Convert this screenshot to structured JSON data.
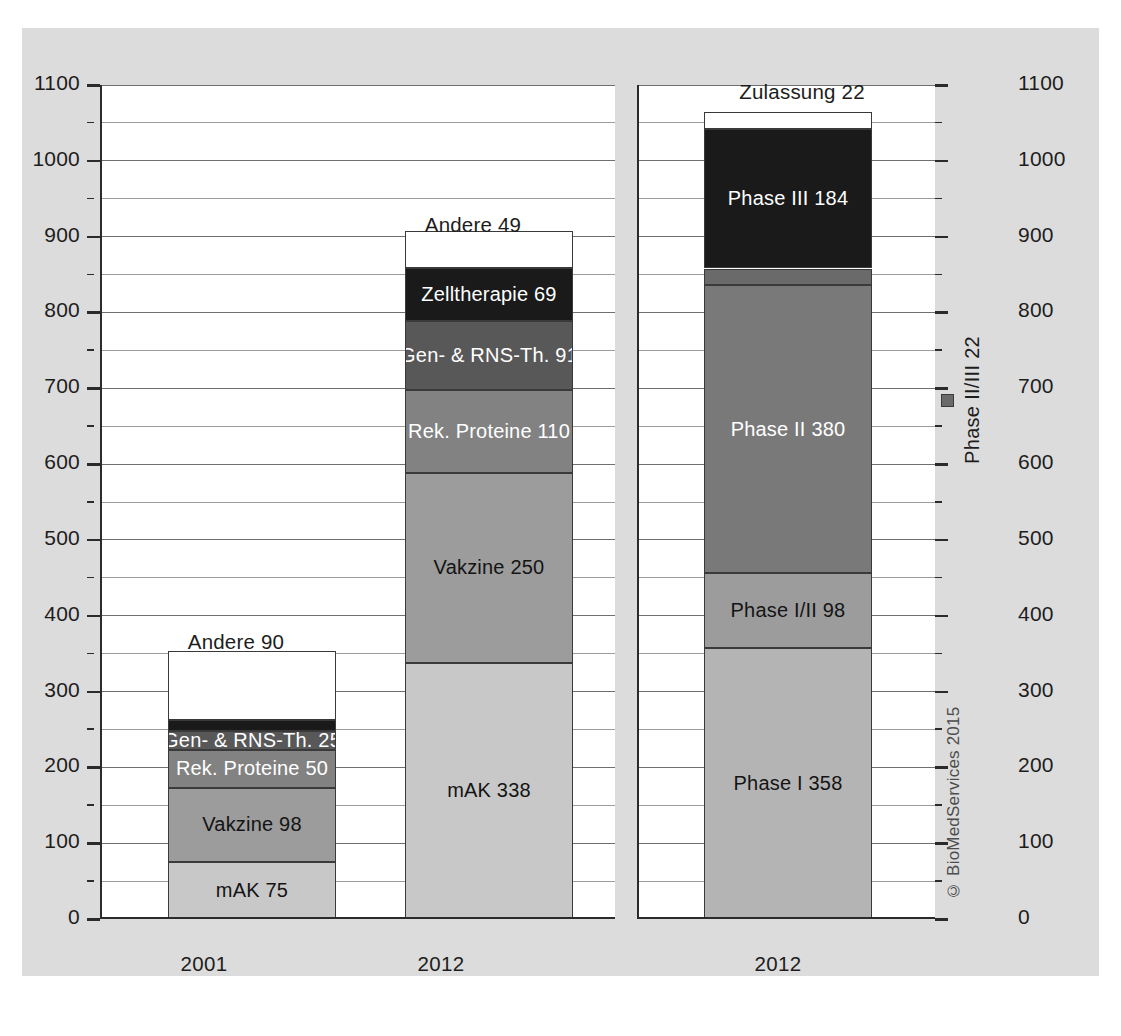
{
  "chart_data": {
    "type": "bar",
    "subtype": "stacked",
    "title": "",
    "xlabel": "",
    "ylabel": "",
    "ylim": [
      0,
      1100
    ],
    "ytick_step": 100,
    "minor_gridline_step": 50,
    "grid": true,
    "legend": "none",
    "panels": [
      {
        "name": "products-by-technology",
        "categories": [
          "2001",
          "2012"
        ],
        "series": [
          {
            "name": "mAK",
            "values": [
              75,
              338
            ],
            "color": "#c8c8c8",
            "label_color": "dark"
          },
          {
            "name": "Vakzine",
            "values": [
              98,
              250
            ],
            "color": "#9c9c9c",
            "label_color": "dark"
          },
          {
            "name": "Rek. Proteine",
            "values": [
              50,
              110
            ],
            "color": "#828282",
            "label_color": "light"
          },
          {
            "name": "Gen- & RNS-Th.",
            "values": [
              25,
              91
            ],
            "color": "#585858",
            "label_color": "light"
          },
          {
            "name": "Zelltherapie",
            "values": [
              15,
              69
            ],
            "color": "#1a1a1a",
            "label_color": "light"
          },
          {
            "name": "Andere",
            "values": [
              90,
              49
            ],
            "color": "#ffffff",
            "label_color": "dark"
          }
        ],
        "bars": [
          {
            "category": "2001",
            "total": 353,
            "segments": [
              {
                "label": "mAK 75",
                "name": "mAK",
                "value": 75,
                "placement": "inside"
              },
              {
                "label": "Vakzine 98",
                "name": "Vakzine",
                "value": 98,
                "placement": "inside"
              },
              {
                "label": "Rek. Proteine 50",
                "name": "Rek. Proteine",
                "value": 50,
                "placement": "inside"
              },
              {
                "label": "Gen- & RNS-Th. 25",
                "name": "Gen- & RNS-Th.",
                "value": 25,
                "placement": "inside"
              },
              {
                "label": "Zelltherapie 15",
                "name": "Zelltherapie",
                "value": 15,
                "placement": "inside-white-with-marker"
              },
              {
                "label": "Andere 90",
                "name": "Andere",
                "value": 90,
                "placement": "above"
              }
            ]
          },
          {
            "category": "2012",
            "total": 907,
            "segments": [
              {
                "label": "mAK 338",
                "name": "mAK",
                "value": 338,
                "placement": "inside"
              },
              {
                "label": "Vakzine 250",
                "name": "Vakzine",
                "value": 250,
                "placement": "inside"
              },
              {
                "label": "Rek. Proteine 110",
                "name": "Rek. Proteine",
                "value": 110,
                "placement": "inside"
              },
              {
                "label": "Gen- & RNS-Th. 91",
                "name": "Gen- & RNS-Th.",
                "value": 91,
                "placement": "inside"
              },
              {
                "label": "Zelltherapie 69",
                "name": "Zelltherapie",
                "value": 69,
                "placement": "inside"
              },
              {
                "label": "Andere 49",
                "name": "Andere",
                "value": 49,
                "placement": "above"
              }
            ]
          }
        ]
      },
      {
        "name": "products-by-clinical-phase",
        "categories": [
          "2012"
        ],
        "series": [
          {
            "name": "Phase I",
            "values": [
              358
            ],
            "color": "#b4b4b4",
            "label_color": "dark"
          },
          {
            "name": "Phase I/II",
            "values": [
              98
            ],
            "color": "#9c9c9c",
            "label_color": "dark"
          },
          {
            "name": "Phase II",
            "values": [
              380
            ],
            "color": "#797979",
            "label_color": "light"
          },
          {
            "name": "Phase II/III",
            "values": [
              22
            ],
            "color": "#6a6a6a",
            "label_color": "light"
          },
          {
            "name": "Phase III",
            "values": [
              184
            ],
            "color": "#1a1a1a",
            "label_color": "light"
          },
          {
            "name": "Zulassung",
            "values": [
              22
            ],
            "color": "#ffffff",
            "label_color": "dark"
          }
        ],
        "bars": [
          {
            "category": "2012",
            "total": 1064,
            "segments": [
              {
                "label": "Phase I 358",
                "name": "Phase I",
                "value": 358,
                "placement": "inside"
              },
              {
                "label": "Phase I/II 98",
                "name": "Phase I/II",
                "value": 98,
                "placement": "inside"
              },
              {
                "label": "Phase II 380",
                "name": "Phase II",
                "value": 380,
                "placement": "inside"
              },
              {
                "label": "Phase II/III 22",
                "name": "Phase II/III",
                "value": 22,
                "placement": "callout-right-rotated"
              },
              {
                "label": "Phase III 184",
                "name": "Phase III",
                "value": 184,
                "placement": "inside"
              },
              {
                "label": "Zulassung 22",
                "name": "Zulassung",
                "value": 22,
                "placement": "above"
              }
            ]
          }
        ]
      }
    ],
    "yticks": [
      "0",
      "100",
      "200",
      "300",
      "400",
      "500",
      "600",
      "700",
      "800",
      "900",
      "1000",
      "1100"
    ],
    "credit": "© BioMedServices 2015"
  },
  "axis": {
    "left_ticks": [
      "1100",
      "1000",
      "900",
      "800",
      "700",
      "600",
      "500",
      "400",
      "300",
      "200",
      "100",
      "0"
    ],
    "right_ticks": [
      "1100",
      "1000",
      "900",
      "800",
      "700",
      "600",
      "500",
      "400",
      "300",
      "200",
      "100",
      "0"
    ]
  },
  "panel_left": {
    "bar_2001": {
      "above_label": "Andere 90",
      "seg_zelltherapie": "Zelltherapie 15",
      "seg_gen_rns": "Gen- & RNS-Th. 25",
      "seg_rek_proteine": "Rek. Proteine 50",
      "seg_vakzine": "Vakzine 98",
      "seg_mak": "mAK 75",
      "xlabel": "2001"
    },
    "bar_2012": {
      "above_label": "Andere 49",
      "seg_zelltherapie": "Zelltherapie 69",
      "seg_gen_rns": "Gen- & RNS-Th. 91",
      "seg_rek_proteine": "Rek. Proteine 110",
      "seg_vakzine": "Vakzine 250",
      "seg_mak": "mAK 338",
      "xlabel": "2012"
    }
  },
  "panel_right": {
    "bar_2012": {
      "above_label": "Zulassung 22",
      "seg_phase3": "Phase III 184",
      "callout_phase23": "Phase II/III 22",
      "seg_phase2": "Phase II 380",
      "seg_phase12": "Phase I/II 98",
      "seg_phase1": "Phase I 358",
      "xlabel": "2012"
    },
    "credit": "© BioMedServices 2015"
  }
}
